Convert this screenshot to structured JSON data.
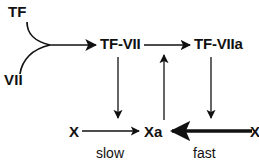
{
  "diagram": {
    "colors": {
      "stroke": "#111111",
      "background": "#ffffff"
    },
    "nodes": [
      {
        "id": "tf",
        "label": "TF"
      },
      {
        "id": "vii",
        "label": "VII"
      },
      {
        "id": "tf_vii",
        "label": "TF-VII"
      },
      {
        "id": "tf_viia",
        "label": "TF-VIIa"
      },
      {
        "id": "x_left",
        "label": "X"
      },
      {
        "id": "xa",
        "label": "Xa"
      },
      {
        "id": "x_right",
        "label": "X"
      }
    ],
    "edges": [
      {
        "id": "tf_to_complex",
        "from": "tf",
        "to": "tf_vii",
        "label": "",
        "style": "curved-join"
      },
      {
        "id": "vii_to_complex",
        "from": "vii",
        "to": "tf_vii",
        "label": "",
        "style": "curved-join"
      },
      {
        "id": "tfvii_to_tfviia",
        "from": "tf_vii",
        "to": "tf_viia",
        "label": "",
        "style": "thin"
      },
      {
        "id": "tfvii_down_to_slow",
        "from": "tf_vii",
        "to": "x_left",
        "label": "",
        "style": "thin"
      },
      {
        "id": "tfviia_down_to_fast",
        "from": "tf_viia",
        "to": "x_right",
        "label": "",
        "style": "thin"
      },
      {
        "id": "xa_up_to_tfvii",
        "from": "xa",
        "to": "tf_viia",
        "label": "",
        "style": "thin"
      },
      {
        "id": "x_to_xa_slow",
        "from": "x_left",
        "to": "xa",
        "label": "slow",
        "style": "thin"
      },
      {
        "id": "x_to_xa_fast",
        "from": "x_right",
        "to": "xa",
        "label": "fast",
        "style": "bold"
      }
    ],
    "edge_labels": {
      "slow": "slow",
      "fast": "fast"
    }
  }
}
